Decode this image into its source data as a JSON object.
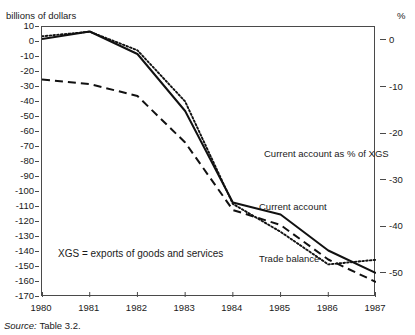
{
  "figure": {
    "cropped_title": "Figure",
    "left_axis_unit": "billions of dollars",
    "right_axis_unit": "%",
    "source_label": "Source:",
    "source_value": "Table 3.2.",
    "note": "XGS = exports of goods and services"
  },
  "annotations": {
    "current_account_pct": "Current account as % of XGS",
    "current_account": "Current account",
    "trade_balance": "Trade balance"
  },
  "chart_data": {
    "type": "line",
    "title": "",
    "xlabel": "",
    "ylabel": "billions of dollars",
    "y2label": "%",
    "x": [
      1980,
      1981,
      1982,
      1983,
      1984,
      1985,
      1986,
      1987
    ],
    "categories": [
      "1980",
      "1981",
      "1982",
      "1983",
      "1984",
      "1985",
      "1986",
      "1987"
    ],
    "ylim": [
      -170,
      10
    ],
    "y2lim": [
      -55,
      3
    ],
    "yticks": [
      10,
      0,
      -10,
      -20,
      -30,
      -40,
      -50,
      -60,
      -70,
      -80,
      -90,
      -100,
      -110,
      -120,
      -130,
      -140,
      -150,
      -160,
      -170
    ],
    "ytick_labels": [
      "10",
      "0",
      "-10",
      "-20",
      "-30",
      "-40",
      "-50",
      "-60",
      "-70",
      "-80",
      "-90",
      "-100",
      "-110",
      "-120",
      "-130",
      "-140",
      "-150",
      "-160",
      "-170"
    ],
    "y2ticks": [
      0,
      -10,
      -20,
      -30,
      -40,
      -50
    ],
    "y2tick_labels": [
      "0",
      "-10",
      "-20",
      "-30",
      "-40",
      "-50"
    ],
    "grid": false,
    "legend_position": "inline-annotations",
    "series": [
      {
        "name": "Current account",
        "axis": "left",
        "style": "solid",
        "color": "#111111",
        "values": [
          2,
          7,
          -8,
          -46,
          -107,
          -115,
          -139,
          -154
        ]
      },
      {
        "name": "Trade balance",
        "axis": "left",
        "style": "dashed",
        "color": "#111111",
        "values": [
          -25,
          -28,
          -36,
          -67,
          -112,
          -122,
          -145,
          -160
        ]
      },
      {
        "name": "Current account as % of XGS",
        "axis": "right",
        "style": "dotted",
        "color": "#111111",
        "values": [
          1,
          2,
          -2,
          -13,
          -35,
          -41,
          -48,
          -47
        ]
      }
    ]
  }
}
